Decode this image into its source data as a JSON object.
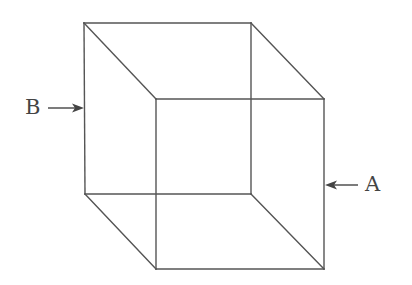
{
  "figure": {
    "type": "necker-cube",
    "colors": {
      "line": "#555555",
      "arrow": "#444444",
      "text": "#444444",
      "background": "#ffffff"
    },
    "vertices": {
      "back_top_left": [
        84,
        23
      ],
      "back_top_right": [
        251,
        23
      ],
      "back_bottom_left": [
        85,
        194
      ],
      "back_bottom_right": [
        251,
        194
      ],
      "front_top_left": [
        156,
        99
      ],
      "front_top_right": [
        324,
        99
      ],
      "front_bottom_left": [
        156,
        269
      ],
      "front_bottom_right": [
        324,
        269
      ]
    }
  },
  "labels": {
    "b": {
      "text": "B",
      "arrow_direction": "right",
      "points_to": "left vertical edge"
    },
    "a": {
      "text": "A",
      "arrow_direction": "left",
      "points_to": "right vertical edge"
    }
  }
}
